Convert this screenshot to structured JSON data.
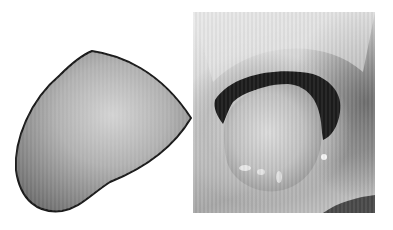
{
  "figure": {
    "panels": [
      {
        "id": "left",
        "kind": "illustration",
        "subject": "tongue-drawing",
        "colors": {
          "fill_light": "#c8c8c8",
          "fill_dark": "#7a7a7a",
          "outline": "#1a1a1a"
        }
      },
      {
        "id": "right",
        "kind": "photograph",
        "subject": "mouth-with-tongue",
        "colors": {
          "lips": "#a0a0a0",
          "cavity": "#1e1e1e",
          "tongue": "#cfcfcf"
        }
      }
    ]
  }
}
